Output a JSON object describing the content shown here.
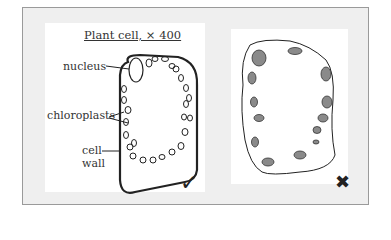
{
  "diagram": {
    "correct_panel": {
      "title": "Plant cell, × 400",
      "labels": {
        "nucleus": "nucleus",
        "chloroplasts": "chloroplasts",
        "cell_wall_line1": "cell",
        "cell_wall_line2": "wall"
      },
      "mark": "✓",
      "mark_meaning": "correct"
    },
    "incorrect_panel": {
      "mark": "✖",
      "mark_meaning": "incorrect"
    },
    "colors": {
      "frame_bg": "#efefef",
      "frame_border": "#9a9a9a",
      "ink": "#222222",
      "chloroplast_shaded": "#8a8a8a"
    }
  }
}
